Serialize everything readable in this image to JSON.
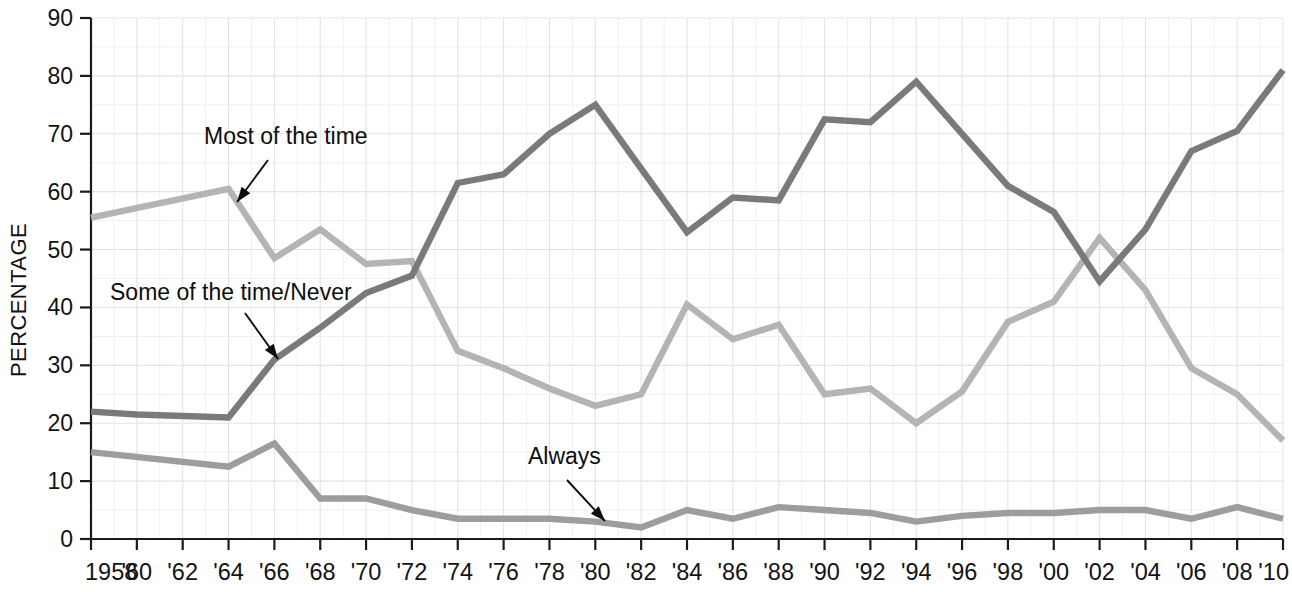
{
  "chart_data": {
    "type": "line",
    "title": "",
    "xlabel": "",
    "ylabel": "PERCENTAGE",
    "ylim": [
      0,
      90
    ],
    "xlim": [
      1958,
      2010
    ],
    "ytick_values": [
      0,
      10,
      20,
      30,
      40,
      50,
      60,
      70,
      80,
      90
    ],
    "ytick_labels": [
      "0",
      "10",
      "20",
      "30",
      "40",
      "50",
      "60",
      "70",
      "80",
      "90"
    ],
    "xtick_values": [
      1958,
      1960,
      1962,
      1964,
      1966,
      1968,
      1970,
      1972,
      1974,
      1976,
      1978,
      1980,
      1982,
      1984,
      1986,
      1988,
      1990,
      1992,
      1994,
      1996,
      1998,
      2000,
      2002,
      2004,
      2006,
      2008,
      2010
    ],
    "xtick_labels": [
      "1958",
      "'60",
      "'62",
      "'64",
      "'66",
      "'68",
      "'70",
      "'72",
      "'74",
      "'76",
      "'78",
      "'80",
      "'82",
      "'84",
      "'86",
      "'88",
      "'90",
      "'92",
      "'94",
      "'96",
      "'98",
      "'00",
      "'02",
      "'04",
      "'06",
      "'08",
      "'10"
    ],
    "grid": true,
    "legend_position": "inline-annotations",
    "series": [
      {
        "name": "Most of the time",
        "color": "#b4b4b4",
        "x": [
          1958,
          1964,
          1966,
          1968,
          1970,
          1972,
          1974,
          1976,
          1978,
          1980,
          1982,
          1984,
          1986,
          1988,
          1990,
          1992,
          1994,
          1996,
          1998,
          2000,
          2002,
          2004,
          2006,
          2008,
          2010
        ],
        "values": [
          55.5,
          60.5,
          48.5,
          53.5,
          47.5,
          48.0,
          32.5,
          29.5,
          26.0,
          23.0,
          25.0,
          40.5,
          34.5,
          37.0,
          25.0,
          26.0,
          20.0,
          25.5,
          37.5,
          41.0,
          52.0,
          43.0,
          29.5,
          25.0,
          17.0
        ]
      },
      {
        "name": "Some of the time/Never",
        "color": "#7a7a7a",
        "x": [
          1958,
          1960,
          1964,
          1966,
          1968,
          1970,
          1972,
          1974,
          1976,
          1978,
          1980,
          1982,
          1984,
          1986,
          1988,
          1990,
          1992,
          1994,
          1996,
          1998,
          2000,
          2002,
          2004,
          2006,
          2008,
          2010
        ],
        "values": [
          22.0,
          21.5,
          21.0,
          31.0,
          36.5,
          42.5,
          45.5,
          61.5,
          63.0,
          70.0,
          75.0,
          64.0,
          53.0,
          59.0,
          58.5,
          72.5,
          72.0,
          79.0,
          70.0,
          61.0,
          56.5,
          44.5,
          53.5,
          67.0,
          70.5,
          81.0
        ]
      },
      {
        "name": "Always",
        "color": "#9d9d9d",
        "x": [
          1958,
          1964,
          1966,
          1968,
          1970,
          1972,
          1974,
          1976,
          1978,
          1980,
          1982,
          1984,
          1986,
          1988,
          1990,
          1992,
          1994,
          1996,
          1998,
          2000,
          2002,
          2004,
          2006,
          2008,
          2010
        ],
        "values": [
          15.0,
          12.5,
          16.5,
          7.0,
          7.0,
          5.0,
          3.5,
          3.5,
          3.5,
          3.0,
          2.0,
          5.0,
          3.5,
          5.5,
          5.0,
          4.5,
          3.0,
          4.0,
          4.5,
          4.5,
          5.0,
          5.0,
          3.5,
          5.5,
          3.5
        ]
      }
    ],
    "annotations": [
      {
        "id": "most-of-the-time",
        "label": "Most of the time",
        "text_x": 204,
        "text_y": 144,
        "arrow_from_x": 268,
        "arrow_from_y": 160,
        "arrow_to_x": 237,
        "arrow_to_y": 202
      },
      {
        "id": "some-of-the-time-never",
        "label": "Some of the time/Never",
        "text_x": 110,
        "text_y": 300,
        "arrow_from_x": 245,
        "arrow_from_y": 313,
        "arrow_to_x": 278,
        "arrow_to_y": 359
      },
      {
        "id": "always",
        "label": "Always",
        "text_x": 528,
        "text_y": 464,
        "arrow_from_x": 567,
        "arrow_from_y": 480,
        "arrow_to_x": 605,
        "arrow_to_y": 521
      }
    ]
  }
}
